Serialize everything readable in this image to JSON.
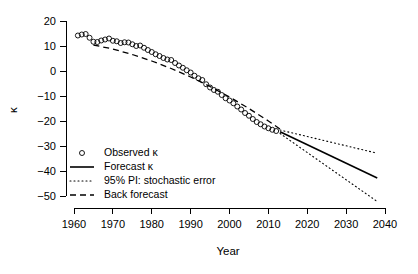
{
  "chart_data": {
    "type": "line",
    "title": "",
    "xlabel": "Year",
    "ylabel": "κ",
    "xlim": [
      1960,
      2040
    ],
    "ylim": [
      -55,
      20
    ],
    "grid": false,
    "legend_position": "bottom-left",
    "xticks": [
      1960,
      1970,
      1980,
      1990,
      2000,
      2010,
      2020,
      2030,
      2040
    ],
    "yticks": [
      20,
      10,
      0,
      -10,
      -20,
      -30,
      -40,
      -50
    ],
    "series": [
      {
        "name": "Observed κ",
        "marker": "open-circle",
        "style": "points",
        "x": [
          1961,
          1962,
          1963,
          1964,
          1965,
          1966,
          1967,
          1968,
          1969,
          1970,
          1971,
          1972,
          1973,
          1974,
          1975,
          1976,
          1977,
          1978,
          1979,
          1980,
          1981,
          1982,
          1983,
          1984,
          1985,
          1986,
          1987,
          1988,
          1989,
          1990,
          1991,
          1992,
          1993,
          1994,
          1995,
          1996,
          1997,
          1998,
          1999,
          2000,
          2001,
          2002,
          2003,
          2004,
          2005,
          2006,
          2007,
          2008,
          2009,
          2010,
          2011,
          2012
        ],
        "values": [
          14.2,
          14.6,
          14.8,
          13.3,
          11.7,
          11.6,
          12.2,
          12.6,
          13.0,
          12.1,
          11.9,
          11.2,
          11.5,
          11.4,
          10.7,
          10.0,
          10.2,
          9.3,
          8.4,
          7.6,
          6.7,
          6.0,
          5.2,
          4.6,
          4.4,
          3.2,
          2.2,
          1.3,
          0.3,
          -0.6,
          -1.9,
          -2.9,
          -3.6,
          -5.3,
          -6.6,
          -7.6,
          -8.3,
          -9.6,
          -10.9,
          -11.8,
          -12.9,
          -14.2,
          -15.4,
          -16.8,
          -17.9,
          -19.2,
          -20.4,
          -21.3,
          -22.2,
          -22.9,
          -23.5,
          -24.0
        ]
      },
      {
        "name": "Forecast κ",
        "style": "solid-line",
        "x": [
          2013,
          2038
        ],
        "values": [
          -24.3,
          -42.8
        ]
      },
      {
        "name": "95% PI: stochastic error (upper)",
        "style": "dotted-line",
        "x": [
          2013,
          2038
        ],
        "values": [
          -23.6,
          -32.9
        ]
      },
      {
        "name": "95% PI: stochastic error (lower)",
        "style": "dotted-line",
        "x": [
          2013,
          2038
        ],
        "values": [
          -25.0,
          -52.2
        ]
      },
      {
        "name": "Back forecast",
        "style": "dashed-line",
        "x": [
          1965,
          1970,
          1975,
          1980,
          1985,
          1990,
          1995,
          2000,
          2005,
          2010,
          2013
        ],
        "values": [
          10.4,
          8.8,
          6.6,
          4.0,
          1.0,
          -2.4,
          -6.2,
          -10.4,
          -15.0,
          -20.0,
          -23.2
        ]
      }
    ],
    "legend": [
      {
        "label": "Observed κ",
        "marker": "open-circle"
      },
      {
        "label": "Forecast κ",
        "marker": "solid-line"
      },
      {
        "label": "95% PI: stochastic error",
        "marker": "dotted-line"
      },
      {
        "label": "Back forecast",
        "marker": "dashed-line"
      }
    ]
  },
  "axes": {
    "x_title": "Year",
    "y_title": "κ",
    "x_tick_labels": [
      "1960",
      "1970",
      "1980",
      "1990",
      "2000",
      "2010",
      "2020",
      "2030",
      "2040"
    ],
    "y_tick_labels": [
      "20",
      "10",
      "0",
      "−10",
      "−20",
      "−30",
      "−40",
      "−50"
    ]
  },
  "legend": {
    "items": [
      {
        "label": "Observed κ"
      },
      {
        "label": "Forecast κ"
      },
      {
        "label": "95% PI: stochastic error"
      },
      {
        "label": "Back forecast"
      }
    ]
  },
  "colors": {
    "ink": "#000000",
    "background": "#ffffff"
  }
}
